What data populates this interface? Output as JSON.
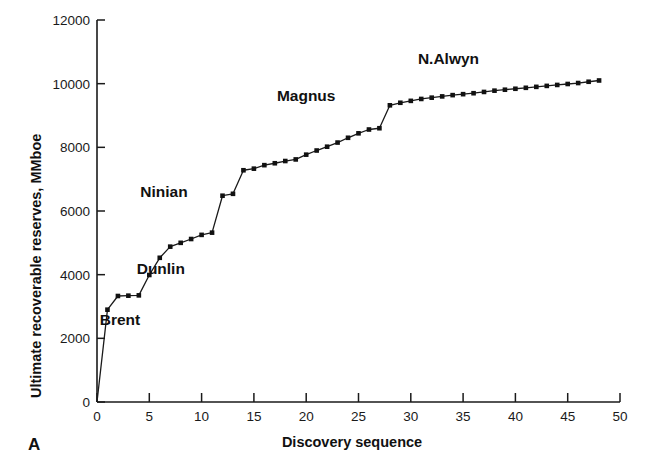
{
  "panel": {
    "label": "A"
  },
  "chart_data": {
    "type": "line",
    "title": "",
    "xlabel": "Discovery sequence",
    "ylabel": "Ultimate recoverable reserves, MMboe",
    "xlim": [
      0,
      50
    ],
    "ylim": [
      0,
      12000
    ],
    "xticks": [
      0,
      5,
      10,
      15,
      20,
      25,
      30,
      35,
      40,
      45,
      50
    ],
    "xticklabels": [
      "0",
      "5",
      "10",
      "15",
      "20",
      "25",
      "30",
      "35",
      "40",
      "45",
      "50"
    ],
    "yticks": [
      0,
      2000,
      4000,
      6000,
      8000,
      10000,
      12000
    ],
    "yticklabels": [
      "0",
      "2000",
      "4000",
      "6000",
      "8000",
      "10000",
      "12000"
    ],
    "grid": false,
    "legend": false,
    "marker": "square",
    "line_color": "#1a1a1a",
    "marker_color": "#111111",
    "series": [
      {
        "name": "Cumulative ultimate recoverable reserves",
        "x": [
          0,
          1,
          2,
          3,
          4,
          5,
          6,
          7,
          8,
          9,
          10,
          11,
          12,
          13,
          14,
          15,
          16,
          17,
          18,
          19,
          20,
          21,
          22,
          23,
          24,
          25,
          26,
          27,
          28,
          29,
          30,
          31,
          32,
          33,
          34,
          35,
          36,
          37,
          38,
          39,
          40,
          41,
          42,
          43,
          44,
          45,
          46,
          47,
          48
        ],
        "values": [
          0,
          2900,
          3330,
          3340,
          3350,
          3990,
          4530,
          4880,
          5000,
          5120,
          5250,
          5320,
          6480,
          6540,
          7280,
          7330,
          7440,
          7500,
          7570,
          7620,
          7770,
          7900,
          8020,
          8150,
          8300,
          8440,
          8560,
          8600,
          9320,
          9400,
          9460,
          9520,
          9560,
          9600,
          9640,
          9670,
          9700,
          9740,
          9780,
          9810,
          9840,
          9870,
          9900,
          9930,
          9960,
          9990,
          10020,
          10060,
          10100
        ]
      }
    ],
    "annotations": [
      {
        "text": "Brent",
        "x": 2.2,
        "y": 2430
      },
      {
        "text": "Dunlin",
        "x": 6.1,
        "y": 4020
      },
      {
        "text": "Ninian",
        "x": 6.4,
        "y": 6450
      },
      {
        "text": "Magnus",
        "x": 20.0,
        "y": 9460
      },
      {
        "text": "N.Alwyn",
        "x": 33.6,
        "y": 10630
      }
    ]
  }
}
